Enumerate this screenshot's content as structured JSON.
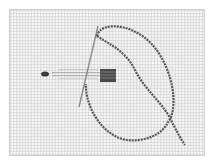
{
  "image": {
    "subject": "needle and twisted thread stitching on canvas mesh",
    "colors": {
      "background": "#ffffff",
      "canvas": "#f4f4f4",
      "border": "#cfcfcf",
      "thread": "#555555",
      "needle": "#8a8a8a",
      "stitches": "#444444"
    }
  }
}
